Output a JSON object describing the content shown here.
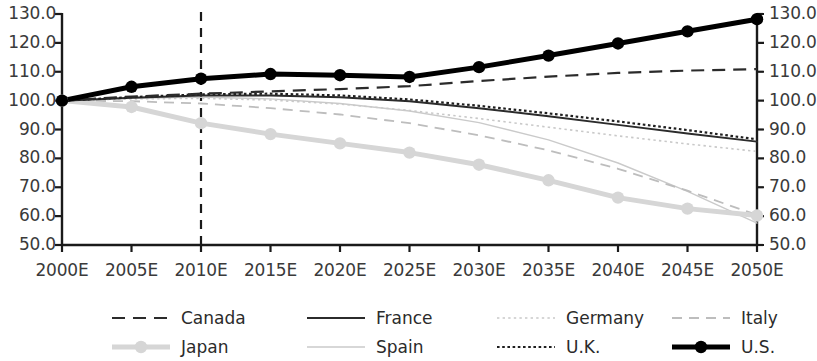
{
  "chart_data": {
    "type": "line",
    "title": "",
    "xlabel": "",
    "ylabel": "",
    "categories": [
      "2000E",
      "2005E",
      "2010E",
      "2015E",
      "2020E",
      "2025E",
      "2030E",
      "2035E",
      "2040E",
      "2045E",
      "2050E"
    ],
    "x_tick_labels": [
      "2000E",
      "2005E",
      "2010E",
      "2015E",
      "2020E",
      "2025E",
      "2030E",
      "2035E",
      "2040E",
      "2045E",
      "2050E"
    ],
    "y_tick_labels": [
      "130.0",
      "120.0",
      "110.0",
      "100.0",
      "90.0",
      "80.0",
      "70.0",
      "60.0",
      "50.0"
    ],
    "y_ticks": [
      130,
      120,
      110,
      100,
      90,
      80,
      70,
      60,
      50
    ],
    "ylim": [
      50,
      130
    ],
    "grid": false,
    "dual_axis": true,
    "legend_position": "bottom",
    "annotations": [
      {
        "type": "vertical-dashed-line",
        "x": "2010E",
        "label": ""
      }
    ],
    "series": [
      {
        "name": "Canada",
        "style": "dashed",
        "color": "#2b2b2b",
        "width": 2.2,
        "markers": false,
        "values": [
          100.0,
          101.4,
          102.4,
          103.2,
          104.0,
          105.0,
          106.8,
          108.3,
          109.6,
          110.4,
          110.9
        ]
      },
      {
        "name": "France",
        "style": "solid",
        "color": "#2b2b2b",
        "width": 2.0,
        "markers": false,
        "values": [
          100.0,
          101.0,
          101.8,
          101.8,
          101.2,
          99.8,
          97.4,
          94.6,
          91.6,
          88.6,
          85.8
        ]
      },
      {
        "name": "Germany",
        "style": "dotted-light",
        "color": "#c9c9c9",
        "width": 1.6,
        "markers": false,
        "values": [
          100.0,
          100.6,
          100.8,
          100.2,
          98.8,
          96.6,
          93.8,
          90.8,
          87.8,
          85.0,
          82.4
        ]
      },
      {
        "name": "Italy",
        "style": "dashed-light",
        "color": "#bdbdbd",
        "width": 1.8,
        "markers": false,
        "values": [
          100.0,
          99.8,
          99.0,
          97.4,
          95.2,
          92.2,
          88.0,
          82.8,
          76.4,
          68.8,
          60.4
        ]
      },
      {
        "name": "Japan",
        "style": "solid-thick-marker",
        "color": "#d6d6d6",
        "width": 5.0,
        "markers": true,
        "values": [
          100.0,
          97.8,
          92.2,
          88.4,
          85.2,
          82.0,
          77.8,
          72.4,
          66.4,
          62.6,
          60.2
        ]
      },
      {
        "name": "Spain",
        "style": "solid-thin-light",
        "color": "#cacaca",
        "width": 1.4,
        "markers": false,
        "values": [
          100.0,
          100.8,
          101.2,
          100.6,
          99.0,
          96.4,
          92.4,
          86.4,
          78.4,
          68.6,
          57.6
        ]
      },
      {
        "name": "U.K.",
        "style": "dotted-dark",
        "color": "#1f1f1f",
        "width": 2.2,
        "markers": false,
        "values": [
          100.0,
          101.2,
          102.2,
          102.4,
          101.8,
          100.4,
          98.2,
          95.6,
          92.8,
          89.8,
          86.6
        ]
      },
      {
        "name": "U.S.",
        "style": "solid-heavy-marker",
        "color": "#000000",
        "width": 5.0,
        "markers": true,
        "values": [
          100.0,
          104.8,
          107.6,
          109.2,
          108.8,
          108.2,
          111.6,
          115.6,
          119.8,
          124.0,
          128.2
        ]
      }
    ]
  },
  "legend": {
    "row1": [
      {
        "label": "Canada",
        "sample": "dashed-dark-line-sample"
      },
      {
        "label": "France",
        "sample": "solid-dark-line-sample"
      },
      {
        "label": "Germany",
        "sample": "dotted-light-line-sample"
      },
      {
        "label": "Italy",
        "sample": "dashed-light-line-sample"
      }
    ],
    "row2": [
      {
        "label": "Japan",
        "sample": "thick-light-marker-line-sample"
      },
      {
        "label": "Spain",
        "sample": "thin-light-line-sample"
      },
      {
        "label": "U.K.",
        "sample": "dotted-dark-line-sample"
      },
      {
        "label": "U.S.",
        "sample": "thick-black-marker-line-sample"
      }
    ]
  }
}
